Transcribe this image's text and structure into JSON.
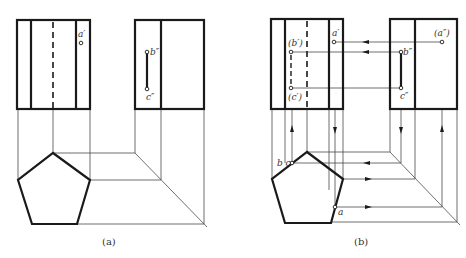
{
  "figure_a": {
    "caption": "(a)",
    "front_view": {
      "x1": 17,
      "y1": 20,
      "x2": 90,
      "y2": 109,
      "inner_lines": [
        31,
        76
      ],
      "hidden_line": 53
    },
    "side_view": {
      "x1": 135,
      "y1": 20,
      "x2": 204,
      "y2": 109,
      "inner_line": 161
    },
    "points": [
      {
        "label": "a′",
        "x": 81,
        "y": 43
      },
      {
        "label": "b″",
        "x": 147,
        "y": 52
      },
      {
        "label": "c″",
        "x": 147,
        "y": 89
      }
    ],
    "pentagon": [
      [
        53,
        153
      ],
      [
        90,
        180
      ],
      [
        77,
        224
      ],
      [
        32,
        224
      ],
      [
        18,
        180
      ]
    ]
  },
  "figure_b": {
    "caption": "(b)",
    "front_view": {
      "x1": 271,
      "y1": 19,
      "x2": 343,
      "y2": 109,
      "inner_lines": [
        285,
        329
      ],
      "hidden_line": 307
    },
    "side_view": {
      "x1": 390,
      "y1": 19,
      "x2": 457,
      "y2": 109,
      "inner_line": 415
    },
    "points": [
      {
        "label": "a′",
        "x": 334,
        "y": 42
      },
      {
        "label": "(b′)",
        "x": 291,
        "y": 52
      },
      {
        "label": "(c′)",
        "x": 291,
        "y": 88
      },
      {
        "label": "(a″)",
        "x": 442,
        "y": 42
      },
      {
        "label": "b″",
        "x": 401,
        "y": 52
      },
      {
        "label": "c″",
        "x": 401,
        "y": 88
      },
      {
        "label": "b c",
        "x": 292,
        "y": 163
      },
      {
        "label": "a",
        "x": 335,
        "y": 207
      }
    ],
    "pentagon": [
      [
        307,
        152
      ],
      [
        343,
        179
      ],
      [
        331,
        223
      ],
      [
        285,
        223
      ],
      [
        272,
        179
      ]
    ]
  }
}
